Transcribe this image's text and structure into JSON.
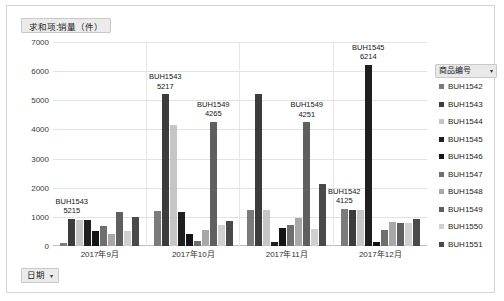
{
  "window": {
    "value_field_label": "求和项:销量（件）",
    "date_field_label": "日期",
    "caret_glyph": "▾"
  },
  "legend": {
    "title": "商品编号",
    "caret_glyph": "▾",
    "items": [
      {
        "label": "BUH1542",
        "color": "#7b7b7b"
      },
      {
        "label": "BUH1543",
        "color": "#3c3c3c"
      },
      {
        "label": "BUH1544",
        "color": "#c6c6c6"
      },
      {
        "label": "BUH1545",
        "color": "#1f1f1f"
      },
      {
        "label": "BUH1546",
        "color": "#151515"
      },
      {
        "label": "BUH1547",
        "color": "#6f6f6f"
      },
      {
        "label": "BUH1548",
        "color": "#a8a8a8"
      },
      {
        "label": "BUH1549",
        "color": "#5f5f5f"
      },
      {
        "label": "BUH1550",
        "color": "#d0d0d0"
      },
      {
        "label": "BUH1551",
        "color": "#4a4a4a"
      }
    ]
  },
  "chart_data": {
    "type": "bar",
    "title": "求和项:销量（件）",
    "xlabel": "日期",
    "ylabel": "求和项:销量（件）",
    "ylim": [
      0,
      7000
    ],
    "yticks": [
      7000,
      6000,
      5000,
      4000,
      3000,
      2000,
      1000,
      0
    ],
    "grid": true,
    "legend_position": "right",
    "categories": [
      "2017年9月",
      "2017年10月",
      "2017年11月",
      "2017年12月"
    ],
    "series": [
      {
        "name": "BUH1542",
        "color": "#7b7b7b",
        "values": [
          120,
          1190,
          1230,
          1270
        ]
      },
      {
        "name": "BUH1543",
        "color": "#3c3c3c",
        "values": [
          930,
          5215,
          5217,
          1250
        ]
      },
      {
        "name": "BUH1544",
        "color": "#c6c6c6",
        "values": [
          880,
          4150,
          1240,
          1240
        ]
      },
      {
        "name": "BUH1545",
        "color": "#1f1f1f",
        "values": [
          900,
          1180,
          130,
          6214
        ]
      },
      {
        "name": "BUH1546",
        "color": "#151515",
        "values": [
          520,
          420,
          620,
          140
        ]
      },
      {
        "name": "BUH1547",
        "color": "#6f6f6f",
        "values": [
          690,
          170,
          720,
          540
        ]
      },
      {
        "name": "BUH1548",
        "color": "#a8a8a8",
        "values": [
          420,
          560,
          950,
          830
        ]
      },
      {
        "name": "BUH1549",
        "color": "#5f5f5f",
        "values": [
          1180,
          4265,
          4251,
          790
        ]
      },
      {
        "name": "BUH1550",
        "color": "#d0d0d0",
        "values": [
          520,
          720,
          590,
          800
        ]
      },
      {
        "name": "BUH1551",
        "color": "#4a4a4a",
        "values": [
          980,
          860,
          2140,
          940
        ]
      }
    ],
    "annotations": [
      {
        "series": "BUH1543",
        "category": "2017年9月",
        "name": "BUH1543",
        "value": 5215
      },
      {
        "series": "BUH1549",
        "category": "2017年10月",
        "name": "BUH1549",
        "value": 4265
      },
      {
        "series": "BUH1543",
        "category": "2017年10月",
        "name": "BUH1543",
        "value": 5217
      },
      {
        "series": "BUH1549",
        "category": "2017年11月",
        "name": "BUH1549",
        "value": 4251
      },
      {
        "series": "BUH1542",
        "category": "2017年12月",
        "name": "BUH1542",
        "value": 4125
      },
      {
        "series": "BUH1545",
        "category": "2017年12月",
        "name": "BUH1545",
        "value": 6214
      }
    ]
  }
}
